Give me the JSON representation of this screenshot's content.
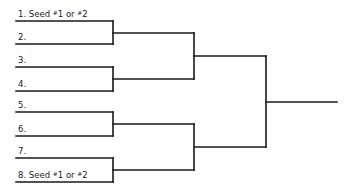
{
  "bracket": {
    "title": "",
    "slots": [
      {
        "number": "1.",
        "text": "Seed",
        "seed_note": [
          "1",
          "2"
        ]
      },
      {
        "number": "2.",
        "text": "",
        "seed_note": null
      },
      {
        "number": "3.",
        "text": "",
        "seed_note": null
      },
      {
        "number": "4.",
        "text": "",
        "seed_note": null
      },
      {
        "number": "5.",
        "text": "",
        "seed_note": null
      },
      {
        "number": "6.",
        "text": "",
        "seed_note": null
      },
      {
        "number": "7.",
        "text": "",
        "seed_note": null
      },
      {
        "number": "8.",
        "text": "Seed",
        "seed_note": [
          "1",
          "2"
        ]
      }
    ],
    "seed_connector": "or",
    "seed_symbol": "#",
    "rounds": 3,
    "line_color": "#1a1a1a"
  }
}
